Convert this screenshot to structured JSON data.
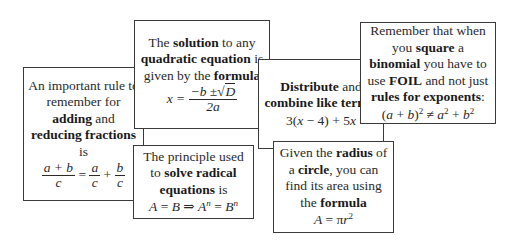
{
  "cards": [
    {
      "id": "adding-fractions",
      "text": [
        {
          "t": "An important rule to remember for ",
          "bold": false
        },
        {
          "t": "adding",
          "bold": true
        },
        {
          "t": " and ",
          "bold": false
        },
        {
          "t": "reducing fractions",
          "bold": true
        },
        {
          "t": " is",
          "bold": false
        }
      ],
      "formula": "(a + b)/c = a/c + b/c"
    },
    {
      "id": "quadratic-formula",
      "text": [
        {
          "t": "The ",
          "bold": false
        },
        {
          "t": "solution",
          "bold": true
        },
        {
          "t": " to any ",
          "bold": false
        },
        {
          "t": "quadratic equation",
          "bold": true
        },
        {
          "t": " is given by the ",
          "bold": false
        },
        {
          "t": "formula",
          "bold": true
        }
      ],
      "formula": "x = (−b ± √D) / 2a"
    },
    {
      "id": "radical-equations",
      "text": [
        {
          "t": "The principle used to ",
          "bold": false
        },
        {
          "t": "solve radical equations",
          "bold": true
        },
        {
          "t": " is",
          "bold": false
        }
      ],
      "formula": "A = B ⇒ Aⁿ = Bⁿ"
    },
    {
      "id": "distribute-combine",
      "text": [
        {
          "t": "Distribute",
          "bold": true
        },
        {
          "t": " and ",
          "bold": false
        },
        {
          "t": "combine like terms",
          "bold": true
        },
        {
          "t": ":",
          "bold": false
        }
      ],
      "formula": "3(x − 4) + 5x"
    },
    {
      "id": "circle-area",
      "text": [
        {
          "t": "Given the ",
          "bold": false
        },
        {
          "t": "radius",
          "bold": true
        },
        {
          "t": " of a ",
          "bold": false
        },
        {
          "t": "circle",
          "bold": true
        },
        {
          "t": ", you can find its area using the ",
          "bold": false
        },
        {
          "t": "formula",
          "bold": true
        }
      ],
      "formula": "A = πr²"
    },
    {
      "id": "square-binomial",
      "text": [
        {
          "t": "Remember that when you ",
          "bold": false
        },
        {
          "t": "square",
          "bold": true
        },
        {
          "t": " a ",
          "bold": false
        },
        {
          "t": "binomial",
          "bold": true
        },
        {
          "t": " you have to use ",
          "bold": false
        },
        {
          "t": "FOIL",
          "bold": true
        },
        {
          "t": " and not just ",
          "bold": false
        },
        {
          "t": "rules for exponents",
          "bold": true
        },
        {
          "t": ":",
          "bold": false
        }
      ],
      "formula": "(a + b)² ≠ a² + b²"
    }
  ],
  "formula_parts": {
    "c1": {
      "num": "a + b",
      "den": "c",
      "eq": "=",
      "a": "a",
      "c1": "c",
      "plus": "+",
      "b": "b",
      "c2": "c"
    },
    "c2": {
      "lhs": "x =",
      "num_pre": "−b ±",
      "rad": "D",
      "den": "2a"
    },
    "c3": {
      "p1": "A",
      "p2": " = ",
      "p3": "B",
      "p4": " ⇒ ",
      "p5": "A",
      "e1": "n",
      "p6": " = ",
      "p7": "B",
      "e2": "n"
    },
    "c4": {
      "p1": "3(",
      "x1": "x",
      "p2": " − 4) + 5",
      "x2": "x"
    },
    "c5": {
      "A": "A",
      "eq": " = π",
      "r": "r",
      "exp": "2"
    },
    "c6": {
      "p1": "(",
      "a1": "a",
      "p2": " + ",
      "b1": "b",
      "p3": ")",
      "e1": "2",
      "neq": " ≠ ",
      "a2": "a",
      "e2": "2",
      "p4": " + ",
      "b2": "b",
      "e3": "2"
    }
  }
}
